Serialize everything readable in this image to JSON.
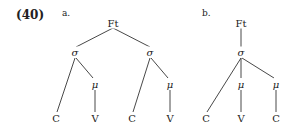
{
  "example_number": "(40)",
  "trees": [
    {
      "label": "a.",
      "nodes": {
        "root": "Ft",
        "syl1": "σ",
        "syl2": "σ",
        "mora1": "μ",
        "mora2": "μ",
        "c1": "C",
        "v1": "V",
        "c2": "C",
        "v2": "V"
      }
    },
    {
      "label": "b.",
      "nodes": {
        "root": "Ft",
        "syl": "σ",
        "mora1": "μ",
        "mora2": "μ",
        "c1": "C",
        "v1": "V",
        "c2": "C"
      }
    }
  ],
  "colors": {
    "ink": "#222222",
    "background": "#ffffff"
  }
}
